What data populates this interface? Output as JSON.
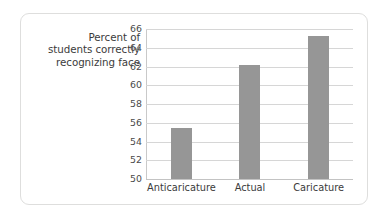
{
  "chart_data": {
    "type": "bar",
    "title": "",
    "subtitle": "",
    "xlabel": "",
    "ylabel": "Percent of students correctly recognizing face",
    "ylabel_lines": [
      "Percent of",
      "students correctly",
      "recognizing face"
    ],
    "categories": [
      "Anticaricature",
      "Actual",
      "Caricature"
    ],
    "values": [
      55.4,
      62.2,
      65.3
    ],
    "series": [
      {
        "name": "Percent of students correctly recognizing face",
        "values": [
          55.4,
          62.2,
          65.3
        ]
      }
    ],
    "ylim": [
      50,
      66
    ],
    "yticks": [
      50,
      52,
      54,
      56,
      58,
      60,
      62,
      64,
      66
    ],
    "ytick_labels": [
      "50",
      "52",
      "54",
      "56",
      "58",
      "60",
      "62",
      "64",
      "66"
    ],
    "grid": true,
    "grid_axis": "y",
    "legend": false,
    "legend_position": "none",
    "bar_color": "#969696",
    "gridline_color": "#d6d6d6",
    "axis_line_color": "#c9c9c9",
    "text_color": "#3b3b3b",
    "background_color": "#ffffff",
    "card_border_color": "#dededd"
  }
}
